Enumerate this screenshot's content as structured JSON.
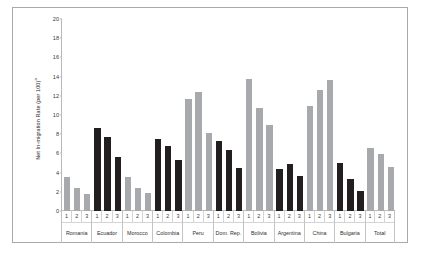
{
  "chart_data": {
    "type": "bar",
    "title": "",
    "xlabel": "",
    "ylabel": "Net In-migration Rate (per 100)",
    "ylabel_superscript": "a",
    "ylim": [
      0,
      20
    ],
    "yticks": [
      0,
      2,
      4,
      6,
      8,
      10,
      12,
      14,
      16,
      18,
      20
    ],
    "grid": false,
    "legend": "none",
    "subcategories": [
      "1",
      "2",
      "3"
    ],
    "categories": [
      "Romania",
      "Ecuador",
      "Morocco",
      "Colombia",
      "Peru",
      "Dom. Rep.",
      "Bolivia",
      "Argentina",
      "China",
      "Bulgaria",
      "Total"
    ],
    "groups": [
      {
        "name": "Romania",
        "color": "gray",
        "values": [
          3.5,
          2.4,
          1.8
        ]
      },
      {
        "name": "Ecuador",
        "color": "dark",
        "values": [
          8.6,
          7.7,
          5.6
        ]
      },
      {
        "name": "Morocco",
        "color": "gray",
        "values": [
          3.5,
          2.4,
          1.9
        ]
      },
      {
        "name": "Colombia",
        "color": "dark",
        "values": [
          7.5,
          6.8,
          5.3
        ]
      },
      {
        "name": "Peru",
        "color": "gray",
        "values": [
          11.7,
          12.4,
          8.1
        ]
      },
      {
        "name": "Dom. Rep.",
        "color": "dark",
        "values": [
          7.3,
          6.4,
          4.5
        ]
      },
      {
        "name": "Bolivia",
        "color": "gray",
        "values": [
          13.7,
          10.7,
          9.0
        ]
      },
      {
        "name": "Argentina",
        "color": "dark",
        "values": [
          4.4,
          4.9,
          3.6
        ]
      },
      {
        "name": "China",
        "color": "gray",
        "values": [
          10.9,
          12.6,
          13.6
        ]
      },
      {
        "name": "Bulgaria",
        "color": "dark",
        "values": [
          5.0,
          3.3,
          2.1
        ]
      },
      {
        "name": "Total",
        "color": "gray",
        "values": [
          6.6,
          5.9,
          4.6
        ]
      }
    ],
    "colors": {
      "dark_series": "#231f20",
      "gray_series": "#a7a9ac",
      "axis": "#b9b9b9",
      "border": "#a9a9a9",
      "text": "#2f2f2f"
    }
  }
}
